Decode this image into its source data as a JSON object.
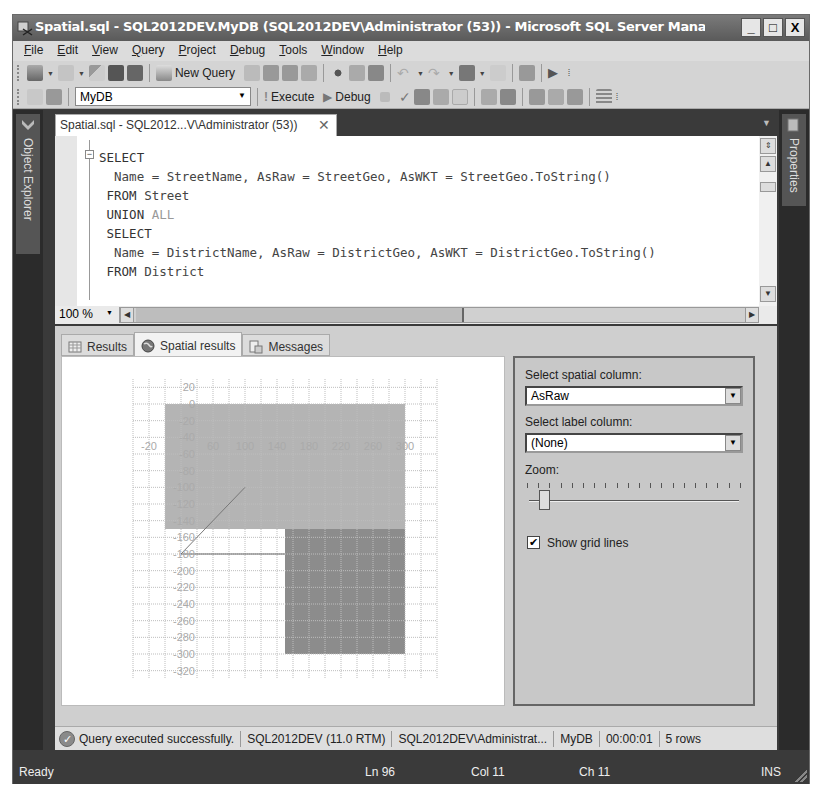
{
  "window": {
    "title": "Spatial.sql - SQL2012DEV.MyDB (SQL2012DEV\\Administrator (53)) - Microsoft SQL Server Management ...",
    "controls": {
      "minimize": "_",
      "maximize": "□",
      "close": "X"
    }
  },
  "menubar": {
    "items": [
      {
        "label": "File",
        "mnemonic": "F"
      },
      {
        "label": "Edit",
        "mnemonic": "E"
      },
      {
        "label": "View",
        "mnemonic": "V"
      },
      {
        "label": "Query",
        "mnemonic": "Q"
      },
      {
        "label": "Project",
        "mnemonic": "P"
      },
      {
        "label": "Debug",
        "mnemonic": "D"
      },
      {
        "label": "Tools",
        "mnemonic": "T"
      },
      {
        "label": "Window",
        "mnemonic": "W"
      },
      {
        "label": "Help",
        "mnemonic": "H"
      }
    ]
  },
  "toolbar1": {
    "new_query_label": "New Query",
    "icons": [
      "new-project-icon",
      "add-item-icon",
      "open-file-icon",
      "save-icon",
      "save-all-icon",
      "new-query-icon",
      "database-engine-query-icon",
      "analysis-mdx-query-icon",
      "analysis-dmx-query-icon",
      "analysis-xmla-query-icon",
      "cut-icon",
      "copy-icon",
      "paste-icon",
      "undo-icon",
      "redo-icon",
      "navigate-backward-icon",
      "navigate-forward-icon",
      "activity-monitor-icon",
      "start-debugging-icon"
    ]
  },
  "toolbar2": {
    "database": "MyDB",
    "execute_label": "Execute",
    "debug_label": "Debug",
    "icons": [
      "connect-icon",
      "change-connection-icon",
      "cancel-query-icon",
      "parse-icon",
      "display-estimated-plan-icon",
      "query-designer-icon",
      "specify-template-values-icon",
      "include-actual-plan-icon",
      "include-client-statistics-icon",
      "results-to-text-icon",
      "results-to-grid-icon",
      "results-to-file-icon",
      "comment-icon"
    ]
  },
  "docks": {
    "left": "Object Explorer",
    "right": "Properties"
  },
  "document_tab": {
    "label": "Spatial.sql - SQL2012...V\\Administrator (53))",
    "close": "✕"
  },
  "editor": {
    "lines": [
      [
        {
          "t": "SELECT",
          "c": "kw"
        }
      ],
      [
        {
          "t": "  Name = StreetName, AsRaw = StreetGeo, AsWKT = StreetGeo.ToString()",
          "c": ""
        }
      ],
      [
        {
          "t": " FROM",
          "c": "kw"
        },
        {
          "t": " Street",
          "c": ""
        }
      ],
      [
        {
          "t": " UNION",
          "c": "kw"
        },
        {
          "t": " ALL",
          "c": "kw-gray"
        }
      ],
      [
        {
          "t": " SELECT",
          "c": "kw"
        }
      ],
      [
        {
          "t": "  Name = DistrictName, AsRaw = DistrictGeo, AsWKT = DistrictGeo.ToString()",
          "c": ""
        }
      ],
      [
        {
          "t": " FROM",
          "c": "kw"
        },
        {
          "t": " District",
          "c": ""
        }
      ]
    ],
    "zoom": "100 %"
  },
  "results_tabs": [
    {
      "label": "Results",
      "icon": "grid-icon",
      "active": false
    },
    {
      "label": "Spatial results",
      "icon": "globe-icon",
      "active": true
    },
    {
      "label": "Messages",
      "icon": "messages-icon",
      "active": false
    }
  ],
  "spatial_options": {
    "spatial_column_label": "Select spatial column:",
    "spatial_column_value": "AsRaw",
    "label_column_label": "Select label column:",
    "label_column_value": "(None)",
    "zoom_label": "Zoom:",
    "zoom_ticks": 20,
    "zoom_position": 1,
    "show_grid_lines_label": "Show grid lines",
    "show_grid_lines": true
  },
  "chart_data": {
    "type": "spatial",
    "title": "",
    "x_ticks": [
      -20,
      60,
      100,
      140,
      180,
      220,
      260,
      300
    ],
    "y_ticks": [
      20,
      0,
      -20,
      -40,
      -60,
      -80,
      -100,
      -120,
      -140,
      -160,
      -180,
      -200,
      -220,
      -240,
      -260,
      -280,
      -300,
      -320
    ],
    "xlim": [
      -40,
      340
    ],
    "ylim": [
      -330,
      30
    ],
    "grid": true,
    "shapes": [
      {
        "kind": "polygon",
        "shade": "light",
        "color": "#b4b4b4",
        "x": [
          0,
          300
        ],
        "y": [
          -150,
          0
        ]
      },
      {
        "kind": "polygon",
        "shade": "dark",
        "color": "#8c8c8c",
        "x": [
          150,
          300
        ],
        "y": [
          -300,
          -150
        ]
      },
      {
        "kind": "linestring",
        "color": "#777777",
        "points": [
          [
            100,
            -100
          ],
          [
            20,
            -180
          ]
        ]
      },
      {
        "kind": "linestring",
        "color": "#666666",
        "points": [
          [
            20,
            -180
          ],
          [
            150,
            -180
          ]
        ]
      }
    ]
  },
  "query_status": {
    "message": "Query executed successfully.",
    "server": "SQL2012DEV (11.0 RTM)",
    "user": "SQL2012DEV\\Administrat...",
    "database": "MyDB",
    "elapsed": "00:00:01",
    "rows": "5 rows"
  },
  "statusbar": {
    "ready": "Ready",
    "ln": "Ln 96",
    "col": "Col 11",
    "ch": "Ch 11",
    "mode": "INS"
  }
}
